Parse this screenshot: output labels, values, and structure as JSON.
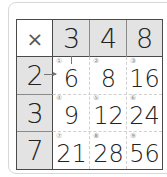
{
  "table": {
    "operator": "×",
    "column_headers": [
      "3",
      "4",
      "8"
    ],
    "row_headers": [
      "2",
      "3",
      "7"
    ],
    "cells": [
      [
        {
          "index": "①",
          "value": "6"
        },
        {
          "index": "②",
          "value": "8"
        },
        {
          "index": "③",
          "value": "16"
        }
      ],
      [
        {
          "index": "④",
          "value": "9"
        },
        {
          "index": "⑤",
          "value": "12"
        },
        {
          "index": "⑥",
          "value": "24"
        }
      ],
      [
        {
          "index": "⑦",
          "value": "21"
        },
        {
          "index": "⑧",
          "value": "28"
        },
        {
          "index": "⑨",
          "value": "56"
        }
      ]
    ]
  },
  "colors": {
    "header_bg": "#e3e3e3",
    "border": "#4a4a4a",
    "text": "#222222"
  }
}
